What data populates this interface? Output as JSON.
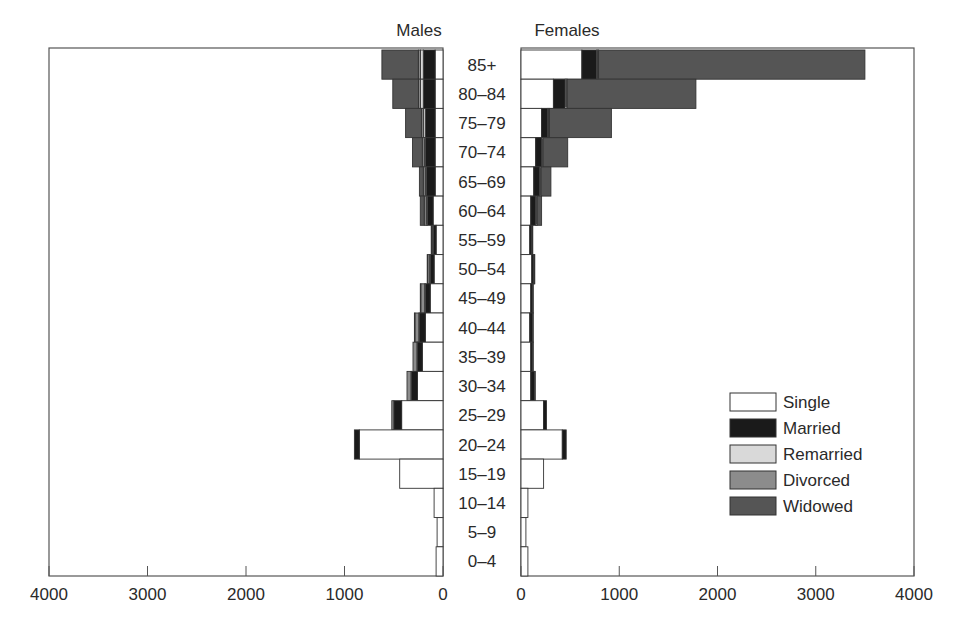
{
  "chart_data": {
    "type": "bar",
    "subtype": "population-pyramid-stacked",
    "title": "",
    "panels": [
      {
        "name": "Males",
        "direction": "left",
        "xlim": [
          0,
          4000
        ]
      },
      {
        "name": "Females",
        "direction": "right",
        "xlim": [
          0,
          4000
        ]
      }
    ],
    "categories": [
      "85+",
      "80–84",
      "75–79",
      "70–74",
      "65–69",
      "60–64",
      "55–59",
      "50–54",
      "45–49",
      "40–44",
      "35–39",
      "30–34",
      "25–29",
      "20–24",
      "15–19",
      "10–14",
      "5–9",
      "0–4"
    ],
    "xticks": [
      0,
      1000,
      2000,
      3000,
      4000
    ],
    "xtick_labels_left": [
      "4000",
      "3000",
      "2000",
      "1000",
      "0"
    ],
    "xtick_labels_right": [
      "0",
      "1000",
      "2000",
      "3000",
      "4000"
    ],
    "legend": {
      "position": "lower right of Females panel",
      "entries": [
        {
          "name": "Single",
          "color": "#ffffff"
        },
        {
          "name": "Married",
          "color": "#1a1a1a"
        },
        {
          "name": "Remarried",
          "color": "#d9d9d9"
        },
        {
          "name": "Divorced",
          "color": "#8c8c8c"
        },
        {
          "name": "Widowed",
          "color": "#555555"
        }
      ]
    },
    "series_order": [
      "Single",
      "Married",
      "Remarried",
      "Divorced",
      "Widowed"
    ],
    "males": [
      {
        "age": "85+",
        "Single": 80,
        "Married": 120,
        "Remarried": 30,
        "Divorced": 20,
        "Widowed": 370
      },
      {
        "age": "80–84",
        "Single": 80,
        "Married": 120,
        "Remarried": 30,
        "Divorced": 20,
        "Widowed": 260
      },
      {
        "age": "75–79",
        "Single": 80,
        "Married": 100,
        "Remarried": 20,
        "Divorced": 20,
        "Widowed": 160
      },
      {
        "age": "70–74",
        "Single": 80,
        "Married": 100,
        "Remarried": 10,
        "Divorced": 20,
        "Widowed": 100
      },
      {
        "age": "65–69",
        "Single": 80,
        "Married": 90,
        "Remarried": 10,
        "Divorced": 20,
        "Widowed": 40
      },
      {
        "age": "60–64",
        "Single": 100,
        "Married": 60,
        "Remarried": 10,
        "Divorced": 20,
        "Widowed": 40
      },
      {
        "age": "55–59",
        "Single": 70,
        "Married": 30,
        "Remarried": 5,
        "Divorced": 10,
        "Widowed": 5
      },
      {
        "age": "50–54",
        "Single": 90,
        "Married": 40,
        "Remarried": 5,
        "Divorced": 20,
        "Widowed": 5
      },
      {
        "age": "45–49",
        "Single": 130,
        "Married": 50,
        "Remarried": 5,
        "Divorced": 40,
        "Widowed": 5
      },
      {
        "age": "40–44",
        "Single": 180,
        "Married": 60,
        "Remarried": 5,
        "Divorced": 40,
        "Widowed": 5
      },
      {
        "age": "35–39",
        "Single": 210,
        "Married": 50,
        "Remarried": 5,
        "Divorced": 40,
        "Widowed": 0
      },
      {
        "age": "30–34",
        "Single": 260,
        "Married": 60,
        "Remarried": 5,
        "Divorced": 40,
        "Widowed": 0
      },
      {
        "age": "25–29",
        "Single": 420,
        "Married": 80,
        "Remarried": 0,
        "Divorced": 20,
        "Widowed": 0
      },
      {
        "age": "20–24",
        "Single": 850,
        "Married": 50,
        "Remarried": 0,
        "Divorced": 0,
        "Widowed": 0
      },
      {
        "age": "15–19",
        "Single": 440,
        "Married": 0,
        "Remarried": 0,
        "Divorced": 0,
        "Widowed": 0
      },
      {
        "age": "10–14",
        "Single": 90,
        "Married": 0,
        "Remarried": 0,
        "Divorced": 0,
        "Widowed": 0
      },
      {
        "age": "5–9",
        "Single": 60,
        "Married": 0,
        "Remarried": 0,
        "Divorced": 0,
        "Widowed": 0
      },
      {
        "age": "0–4",
        "Single": 70,
        "Married": 0,
        "Remarried": 0,
        "Divorced": 0,
        "Widowed": 0
      }
    ],
    "females": [
      {
        "age": "85+",
        "Single": 620,
        "Married": 150,
        "Remarried": 10,
        "Divorced": 10,
        "Widowed": 2710
      },
      {
        "age": "80–84",
        "Single": 330,
        "Married": 120,
        "Remarried": 10,
        "Divorced": 10,
        "Widowed": 1310
      },
      {
        "age": "75–79",
        "Single": 210,
        "Married": 60,
        "Remarried": 10,
        "Divorced": 10,
        "Widowed": 630
      },
      {
        "age": "70–74",
        "Single": 150,
        "Married": 60,
        "Remarried": 5,
        "Divorced": 10,
        "Widowed": 250
      },
      {
        "age": "65–69",
        "Single": 130,
        "Married": 60,
        "Remarried": 5,
        "Divorced": 10,
        "Widowed": 100
      },
      {
        "age": "60–64",
        "Single": 100,
        "Married": 50,
        "Remarried": 5,
        "Divorced": 10,
        "Widowed": 45
      },
      {
        "age": "55–59",
        "Single": 90,
        "Married": 20,
        "Remarried": 0,
        "Divorced": 5,
        "Widowed": 5
      },
      {
        "age": "50–54",
        "Single": 110,
        "Married": 20,
        "Remarried": 0,
        "Divorced": 5,
        "Widowed": 5
      },
      {
        "age": "45–49",
        "Single": 100,
        "Married": 20,
        "Remarried": 0,
        "Divorced": 5,
        "Widowed": 0
      },
      {
        "age": "40–44",
        "Single": 90,
        "Married": 30,
        "Remarried": 0,
        "Divorced": 5,
        "Widowed": 0
      },
      {
        "age": "35–39",
        "Single": 100,
        "Married": 20,
        "Remarried": 0,
        "Divorced": 5,
        "Widowed": 0
      },
      {
        "age": "30–34",
        "Single": 100,
        "Married": 40,
        "Remarried": 0,
        "Divorced": 5,
        "Widowed": 0
      },
      {
        "age": "25–29",
        "Single": 230,
        "Married": 30,
        "Remarried": 0,
        "Divorced": 0,
        "Widowed": 0
      },
      {
        "age": "20–24",
        "Single": 420,
        "Married": 40,
        "Remarried": 0,
        "Divorced": 0,
        "Widowed": 0
      },
      {
        "age": "15–19",
        "Single": 230,
        "Married": 0,
        "Remarried": 0,
        "Divorced": 0,
        "Widowed": 0
      },
      {
        "age": "10–14",
        "Single": 70,
        "Married": 0,
        "Remarried": 0,
        "Divorced": 0,
        "Widowed": 0
      },
      {
        "age": "5–9",
        "Single": 50,
        "Married": 0,
        "Remarried": 0,
        "Divorced": 0,
        "Widowed": 0
      },
      {
        "age": "0–4",
        "Single": 70,
        "Married": 0,
        "Remarried": 0,
        "Divorced": 0,
        "Widowed": 0
      }
    ],
    "grid": false
  }
}
